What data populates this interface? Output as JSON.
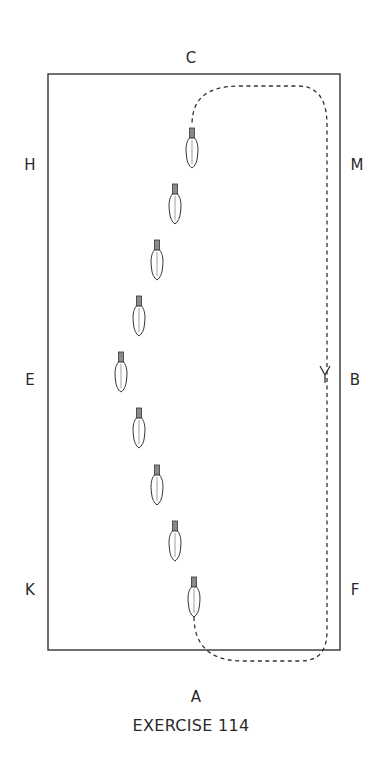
{
  "diagram": {
    "title": "EXERCISE 114",
    "arena": {
      "x": 48,
      "y": 74,
      "width": 292,
      "height": 576,
      "stroke": "#333333"
    },
    "markers": [
      {
        "id": "C",
        "label": "C",
        "x": 191,
        "y": 58
      },
      {
        "id": "H",
        "label": "H",
        "x": 30,
        "y": 165
      },
      {
        "id": "M",
        "label": "M",
        "x": 357,
        "y": 165
      },
      {
        "id": "E",
        "label": "E",
        "x": 30,
        "y": 380
      },
      {
        "id": "B",
        "label": "B",
        "x": 355,
        "y": 380
      },
      {
        "id": "K",
        "label": "K",
        "x": 30,
        "y": 590
      },
      {
        "id": "F",
        "label": "F",
        "x": 355,
        "y": 590
      },
      {
        "id": "A",
        "label": "A",
        "x": 196,
        "y": 697
      }
    ],
    "horses": [
      {
        "x": 192,
        "y": 128
      },
      {
        "x": 175,
        "y": 184
      },
      {
        "x": 157,
        "y": 240
      },
      {
        "x": 139,
        "y": 296
      },
      {
        "x": 121,
        "y": 352
      },
      {
        "x": 139,
        "y": 408
      },
      {
        "x": 157,
        "y": 465
      },
      {
        "x": 175,
        "y": 521
      },
      {
        "x": 194,
        "y": 577
      }
    ],
    "path": {
      "style": "dashed",
      "d": "M 194 617 C 194 640, 205 660, 240 661 L 300 661 C 320 661, 327 650, 327 630 L 327 125 C 327 100, 318 86, 298 86 L 240 86 C 205 86, 192 100, 192 125",
      "direction_arrow": {
        "x": 325,
        "y": 375,
        "direction": "down"
      }
    }
  }
}
